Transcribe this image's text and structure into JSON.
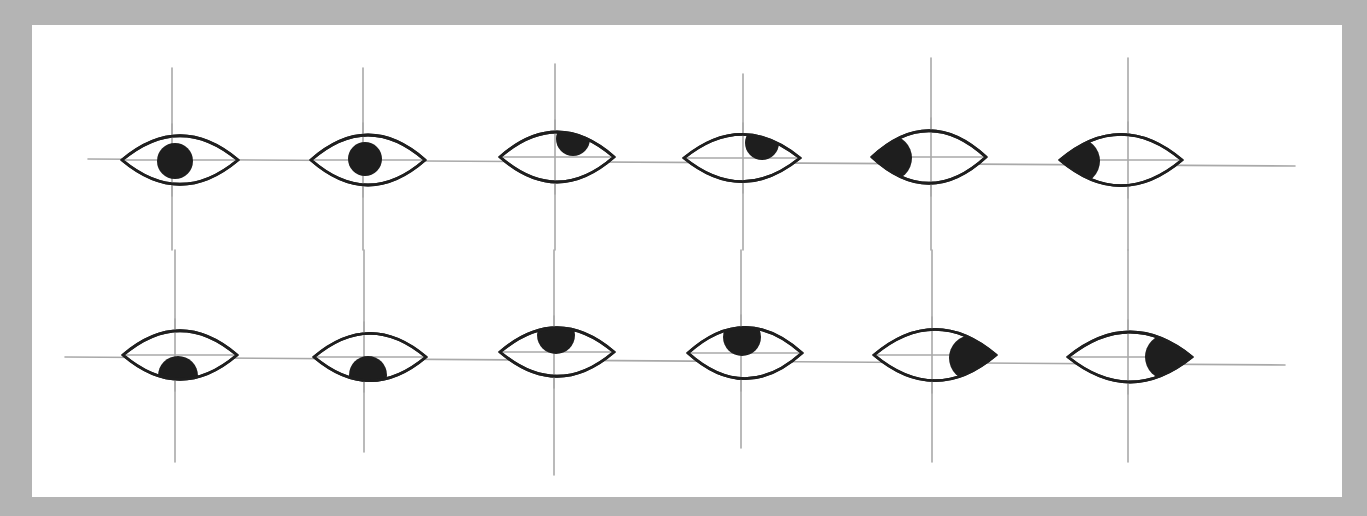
{
  "diagram": {
    "background_color": "#b4b4b4",
    "card_color": "#ffffff",
    "line_color": "#a9a9a9",
    "ink_color": "#1e1e1e",
    "rows": [
      {
        "label": "row-1",
        "horizontal_line": {
          "x1": 88,
          "y1": 159,
          "x2": 1295,
          "y2": 166
        },
        "eyes": [
          {
            "cx": 180,
            "cy": 160,
            "rx": 58,
            "ry": 36,
            "vline": {
              "x": 172,
              "y1": 68,
              "y2": 250
            },
            "gaze": "center",
            "pupil": {
              "cx": 175,
              "cy": 161,
              "r": 18
            }
          },
          {
            "cx": 368,
            "cy": 160,
            "rx": 57,
            "ry": 37,
            "vline": {
              "x": 363,
              "y1": 68,
              "y2": 250
            },
            "gaze": "center",
            "pupil": {
              "cx": 365,
              "cy": 159,
              "r": 17
            }
          },
          {
            "cx": 557,
            "cy": 157,
            "rx": 57,
            "ry": 37,
            "vline": {
              "x": 555,
              "y1": 64,
              "y2": 250
            },
            "gaze": "up-right",
            "pupil": {
              "cx": 573,
              "cy": 139,
              "r": 17
            }
          },
          {
            "cx": 742,
            "cy": 158,
            "rx": 58,
            "ry": 35,
            "vline": {
              "x": 743,
              "y1": 74,
              "y2": 250
            },
            "gaze": "up-right",
            "pupil": {
              "cx": 762,
              "cy": 143,
              "r": 17
            }
          },
          {
            "cx": 929,
            "cy": 157,
            "rx": 57,
            "ry": 39,
            "vline": {
              "x": 931,
              "y1": 58,
              "y2": 250
            },
            "gaze": "left",
            "pupil": {
              "cx": 889,
              "cy": 158,
              "r": 23
            }
          },
          {
            "cx": 1121,
            "cy": 160,
            "rx": 61,
            "ry": 38,
            "vline": {
              "x": 1128,
              "y1": 58,
              "y2": 250
            },
            "gaze": "left",
            "pupil": {
              "cx": 1077,
              "cy": 161,
              "r": 23
            }
          }
        ]
      },
      {
        "label": "row-2",
        "horizontal_line": {
          "x1": 65,
          "y1": 357,
          "x2": 1285,
          "y2": 365
        },
        "eyes": [
          {
            "cx": 180,
            "cy": 355,
            "rx": 57,
            "ry": 36,
            "vline": {
              "x": 175,
              "y1": 250,
              "y2": 462
            },
            "gaze": "down",
            "pupil": {
              "cx": 178,
              "cy": 376,
              "r": 20
            }
          },
          {
            "cx": 370,
            "cy": 357,
            "rx": 56,
            "ry": 35,
            "vline": {
              "x": 364,
              "y1": 250,
              "y2": 452
            },
            "gaze": "down",
            "pupil": {
              "cx": 368,
              "cy": 375,
              "r": 19
            }
          },
          {
            "cx": 557,
            "cy": 352,
            "rx": 57,
            "ry": 36,
            "vline": {
              "x": 554,
              "y1": 250,
              "y2": 475
            },
            "gaze": "up",
            "pupil": {
              "cx": 556,
              "cy": 335,
              "r": 19
            }
          },
          {
            "cx": 745,
            "cy": 353,
            "rx": 57,
            "ry": 38,
            "vline": {
              "x": 741,
              "y1": 250,
              "y2": 448
            },
            "gaze": "up",
            "pupil": {
              "cx": 742,
              "cy": 337,
              "r": 19
            }
          },
          {
            "cx": 935,
            "cy": 355,
            "rx": 61,
            "ry": 38,
            "vline": {
              "x": 932,
              "y1": 250,
              "y2": 462
            },
            "gaze": "right",
            "pupil": {
              "cx": 972,
              "cy": 358,
              "r": 23
            }
          },
          {
            "cx": 1130,
            "cy": 357,
            "rx": 62,
            "ry": 37,
            "vline": {
              "x": 1128,
              "y1": 250,
              "y2": 462
            },
            "gaze": "right",
            "pupil": {
              "cx": 1168,
              "cy": 357,
              "r": 23
            }
          }
        ]
      }
    ]
  }
}
